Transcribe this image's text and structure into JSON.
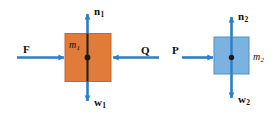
{
  "figure": {
    "type": "free-body-diagram",
    "background_color": "#ffffff",
    "arrow_color": "#2b7fc4",
    "block1_fill": "#e07b39",
    "block1_stroke": "#c8652a",
    "block1_centerline_color": "#231f20",
    "block2_fill": "#7cb2e0",
    "block2_stroke": "#4f8fc4",
    "block2_centerline_color": "#2b7fc4",
    "dot_color": "#1a1a1a"
  },
  "bodies": [
    {
      "id": "block-1",
      "mass_label": "m",
      "mass_subscript": "1",
      "color": "orange",
      "forces": [
        {
          "id": "force-f",
          "label": "F",
          "subscript": "",
          "direction": "right"
        },
        {
          "id": "force-q",
          "label": "Q",
          "subscript": "",
          "direction": "left"
        },
        {
          "id": "force-n1",
          "label": "n",
          "subscript": "1",
          "direction": "up"
        },
        {
          "id": "force-w1",
          "label": "w",
          "subscript": "1",
          "direction": "down"
        }
      ]
    },
    {
      "id": "block-2",
      "mass_label": "m",
      "mass_subscript": "2",
      "color": "blue",
      "forces": [
        {
          "id": "force-p",
          "label": "P",
          "subscript": "",
          "direction": "right"
        },
        {
          "id": "force-n2",
          "label": "n",
          "subscript": "2",
          "direction": "up"
        },
        {
          "id": "force-w2",
          "label": "w",
          "subscript": "2",
          "direction": "down"
        }
      ]
    }
  ],
  "labels": {
    "n1": {
      "text": "n",
      "sub": "1"
    },
    "w1": {
      "text": "w",
      "sub": "1"
    },
    "f": {
      "text": "F",
      "sub": ""
    },
    "q": {
      "text": "Q",
      "sub": ""
    },
    "m1": {
      "text": "m",
      "sub": "1"
    },
    "n2": {
      "text": "n",
      "sub": "2"
    },
    "w2": {
      "text": "w",
      "sub": "2"
    },
    "p": {
      "text": "P",
      "sub": ""
    },
    "m2": {
      "text": "m",
      "sub": "2"
    }
  }
}
